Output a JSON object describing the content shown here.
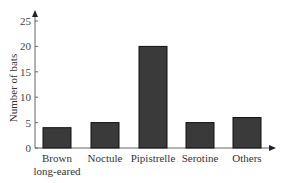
{
  "chart_data": {
    "type": "bar",
    "title": "",
    "xlabel": "",
    "ylabel": "Number of bats",
    "categories": [
      "Brown long-eared",
      "Noctule",
      "Pipistrelle",
      "Serotine",
      "Others"
    ],
    "category_label_lines": [
      [
        "Brown",
        "long-eared"
      ],
      [
        "Noctule"
      ],
      [
        "Pipistrelle"
      ],
      [
        "Serotine"
      ],
      [
        "Others"
      ]
    ],
    "values": [
      4,
      5,
      20,
      5,
      6
    ],
    "ylim": [
      0,
      25
    ],
    "yticks": [
      0,
      5,
      10,
      15,
      20,
      25
    ],
    "grid": false,
    "legend": null,
    "bar_color": "#3a3a3a",
    "bar_edge_color": "#111111"
  }
}
